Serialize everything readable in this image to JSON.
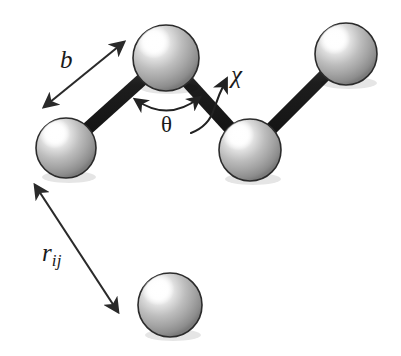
{
  "figure": {
    "kind": "molecular-geometry-diagram",
    "background_color": "#ffffff",
    "stroke_color": "#1a1a1a",
    "bond_color": "#1b1b1b",
    "sphere_body_color": "#a8a8a8",
    "sphere_highlight_color": "#ffffff",
    "sphere_shadow_color": "#6a6a6a",
    "sphere_outline_color": "#2b2b2b"
  },
  "labels": {
    "bond_length": "b",
    "bond_angle": "θ",
    "torsion_angle": "χ",
    "pair_distance_base": "r",
    "pair_distance_sub": "ij"
  },
  "atoms": [
    {
      "id": "atom-1",
      "cx": 66,
      "cy": 148,
      "r": 30,
      "bonded": true
    },
    {
      "id": "atom-2",
      "cx": 166,
      "cy": 58,
      "r": 33,
      "bonded": true
    },
    {
      "id": "atom-3",
      "cx": 250,
      "cy": 150,
      "r": 31,
      "bonded": true
    },
    {
      "id": "atom-4",
      "cx": 346,
      "cy": 54,
      "r": 31,
      "bonded": true
    },
    {
      "id": "atom-5",
      "cx": 170,
      "cy": 305,
      "r": 32,
      "bonded": false
    }
  ],
  "bonds": [
    {
      "id": "bond-1-2",
      "from": "atom-1",
      "to": "atom-2"
    },
    {
      "id": "bond-2-3",
      "from": "atom-2",
      "to": "atom-3"
    },
    {
      "id": "bond-3-4",
      "from": "atom-3",
      "to": "atom-4"
    }
  ],
  "annotations": {
    "b_arrow": {
      "x1": 44,
      "y1": 107,
      "x2": 124,
      "y2": 42,
      "double_headed": true
    },
    "rij_arrow": {
      "x1": 35,
      "y1": 185,
      "x2": 118,
      "y2": 312,
      "double_headed": true
    },
    "theta_arc": {
      "x1": 136,
      "y1": 100,
      "x2": 199,
      "y2": 98,
      "sag": 14,
      "double_headed": true
    },
    "chi_arrow": {
      "start_x": 196,
      "start_y": 129,
      "end_x": 229,
      "end_y": 78,
      "curved": true,
      "double_headed": false
    }
  }
}
